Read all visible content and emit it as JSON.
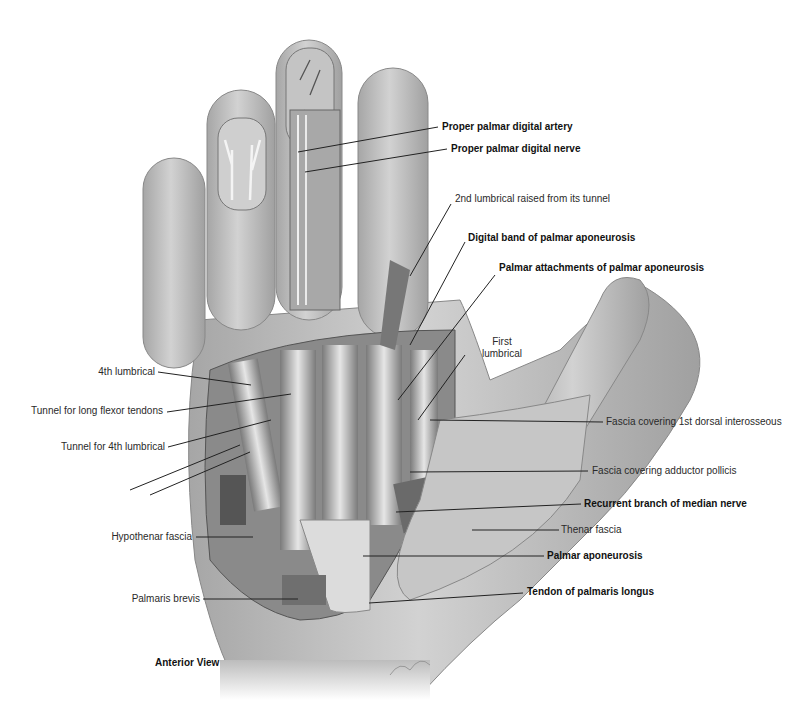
{
  "figure": {
    "view_title": "Anterior View",
    "background": "#ffffff",
    "skin_color": "#b8b8b8",
    "dissection_color": "#8c8c8c",
    "leader_color": "#222222"
  },
  "labels": {
    "proper_palmar_digital_artery": "Proper palmar digital artery",
    "proper_palmar_digital_nerve": "Proper palmar digital nerve",
    "second_lumbrical_raised": "2nd lumbrical raised from its tunnel",
    "digital_band": "Digital band of palmar aponeurosis",
    "palmar_attachments": "Palmar attachments of palmar aponeurosis",
    "first_lumbrical": "First lumbrical",
    "fourth_lumbrical": "4th lumbrical",
    "tunnel_long_flexor": "Tunnel for long flexor tendons",
    "tunnel_4th_lumbrical": "Tunnel for 4th lumbrical",
    "fascia_1st_dorsal_interosseous": "Fascia covering 1st dorsal interosseous",
    "fascia_adductor_pollicis": "Fascia covering adductor pollicis",
    "recurrent_branch_median_nerve": "Recurrent branch of median nerve",
    "thenar_fascia": "Thenar fascia",
    "hypothenar_fascia": "Hypothenar fascia",
    "palmar_aponeurosis": "Palmar aponeurosis",
    "palmaris_brevis": "Palmaris brevis",
    "tendon_palmaris_longus": "Tendon of palmaris longus"
  }
}
